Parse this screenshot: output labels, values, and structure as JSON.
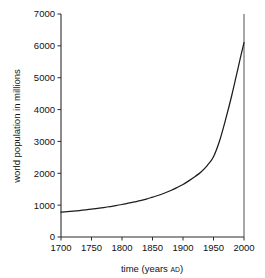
{
  "chart_data": {
    "type": "line",
    "title": "",
    "xlabel": "time (years AD)",
    "xlabel_main": "time (years ",
    "xlabel_small": "AD",
    "xlabel_tail": ")",
    "ylabel": "world population in millions",
    "xlim": [
      1700,
      2000
    ],
    "ylim": [
      0,
      7000
    ],
    "grid": false,
    "legend": false,
    "legend_position": "none",
    "x_ticks": [
      1700,
      1750,
      1800,
      1850,
      1900,
      1950,
      2000
    ],
    "x_tick_labels": [
      "1700",
      "1750",
      "1800",
      "1850",
      "1900",
      "1950",
      "2000"
    ],
    "y_ticks": [
      0,
      1000,
      2000,
      3000,
      4000,
      5000,
      6000,
      7000
    ],
    "y_tick_labels": [
      "0",
      "1000",
      "2000",
      "3000",
      "4000",
      "5000",
      "6000",
      "7000"
    ],
    "series": [
      {
        "name": "world population",
        "color": "#1c1c1c",
        "x": [
          1700,
          1710,
          1720,
          1730,
          1740,
          1750,
          1760,
          1770,
          1780,
          1790,
          1800,
          1810,
          1820,
          1830,
          1840,
          1850,
          1860,
          1870,
          1880,
          1890,
          1900,
          1910,
          1920,
          1930,
          1940,
          1950,
          1960,
          1970,
          1980,
          1990,
          1995,
          2000
        ],
        "values": [
          780,
          795,
          812,
          830,
          850,
          872,
          898,
          925,
          955,
          985,
          1020,
          1060,
          1100,
          1140,
          1190,
          1250,
          1310,
          1380,
          1460,
          1550,
          1650,
          1770,
          1900,
          2050,
          2250,
          2520,
          3020,
          3700,
          4450,
          5280,
          5700,
          6100
        ]
      }
    ],
    "annotations": [
      {
        "name": "year-2000-marker",
        "x": 2000,
        "from": 0,
        "to": 7000
      }
    ]
  }
}
